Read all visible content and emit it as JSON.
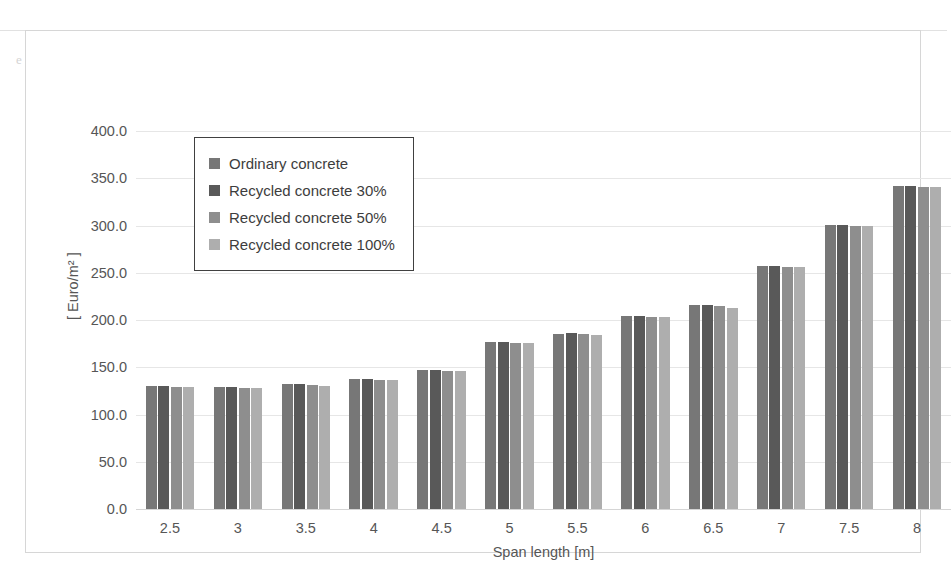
{
  "chart_data": {
    "type": "bar",
    "title": "",
    "xlabel": "Span length [m]",
    "ylabel": "[ Euro/m² ]",
    "categories": [
      "2.5",
      "3",
      "3.5",
      "4",
      "4.5",
      "5",
      "5.5",
      "6",
      "6.5",
      "7",
      "7.5",
      "8"
    ],
    "ylim": [
      0,
      400
    ],
    "yticks": [
      "0.0",
      "50.0",
      "100.0",
      "150.0",
      "200.0",
      "250.0",
      "300.0",
      "350.0",
      "400.0"
    ],
    "ytick_values": [
      0,
      50,
      100,
      150,
      200,
      250,
      300,
      350,
      400
    ],
    "grid": true,
    "legend_position": "upper-left-inside",
    "series": [
      {
        "name": "Ordinary concrete",
        "color": "#777777",
        "values": [
          130,
          129,
          132,
          138,
          147,
          177,
          185,
          204,
          216,
          257,
          301,
          342
        ]
      },
      {
        "name": "Recycled concrete 30%",
        "color": "#595959",
        "values": [
          130,
          129,
          132,
          138,
          147,
          177,
          186,
          204,
          216,
          257,
          301,
          342
        ]
      },
      {
        "name": "Recycled concrete 50%",
        "color": "#8e8e8e",
        "values": [
          129,
          128,
          131,
          137,
          146,
          176,
          185,
          203,
          215,
          256,
          300,
          341
        ]
      },
      {
        "name": "Recycled concrete 100%",
        "color": "#aeaeae",
        "values": [
          129,
          128,
          130,
          137,
          146,
          176,
          184,
          203,
          213,
          256,
          299,
          341
        ]
      }
    ]
  },
  "background_text": {
    "line1": "",
    "line2": "",
    "line3": "e a  a span and with the concrete replacement percentage across the following",
    "bottom": ""
  }
}
